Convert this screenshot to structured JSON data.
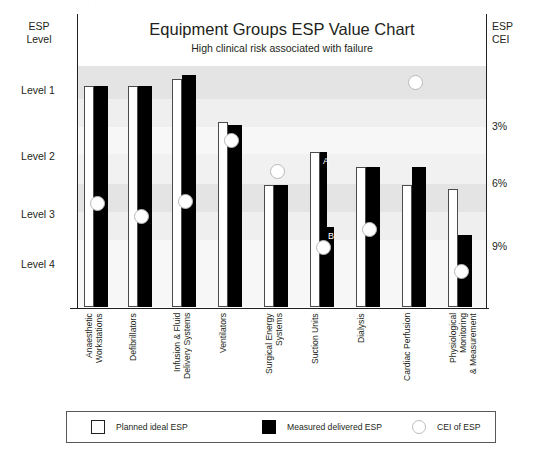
{
  "watermark": "· · ·  ·  ·  ·· ·",
  "header": {
    "title": "Equipment Groups ESP Value Chart",
    "subtitle": "High clinical risk associated with failure",
    "left_axis_title": "ESP\nLevel",
    "left_axis_title_line1": "ESP",
    "left_axis_title_line2": "Level",
    "right_axis_title_line1": "ESP",
    "right_axis_title_line2": "CEI"
  },
  "legend": {
    "items": [
      {
        "label": "Planned ideal ESP",
        "marker": "open-square",
        "color": "#ffffff"
      },
      {
        "label": "Measured delivered ESP",
        "marker": "solid-square",
        "color": "#000000"
      },
      {
        "label": "CEI of ESP",
        "marker": "open-circle",
        "color": "#ffffff"
      }
    ]
  },
  "annotations": [
    {
      "id": "A",
      "text": "A",
      "group": "Suction Units",
      "note": "upper step of measured bar"
    },
    {
      "id": "B",
      "text": "B",
      "group": "Suction Units",
      "note": "lower step of measured bar"
    }
  ],
  "chart_data": {
    "type": "bar",
    "title": "Equipment Groups ESP Value Chart",
    "subtitle": "High clinical risk associated with failure",
    "xlabel": "",
    "ylabel": "ESP Level",
    "y2label": "ESP CEI",
    "grid": false,
    "legend_position": "bottom",
    "ylim": [
      0,
      5
    ],
    "y2lim": [
      0,
      12
    ],
    "ytick_labels": [
      "Level 1",
      "Level 2",
      "Level 3",
      "Level 4"
    ],
    "ytick_values": [
      1,
      2,
      3,
      4
    ],
    "y2tick_labels": [
      "3%",
      "6%",
      "9%"
    ],
    "y2tick_values": [
      3,
      6,
      9
    ],
    "categories": [
      "Anaesthetic\nWorkstations",
      "Defibrillators",
      "Infusion & Fluid\nDelivery Systems",
      "Ventilators",
      "Surgical Energy\nSystems",
      "Suction Units",
      "Dialysis",
      "Cardiac Perfusion",
      "Physiological\nMonitoring\n& Measurement"
    ],
    "series": [
      {
        "name": "Planned ideal ESP",
        "color": "#ffffff",
        "values": [
          4.15,
          4.15,
          4.25,
          3.45,
          2.45,
          3.05,
          2.75,
          2.45,
          2.4
        ]
      },
      {
        "name": "Measured delivered ESP",
        "color": "#000000",
        "values": [
          4.15,
          4.15,
          4.3,
          3.4,
          2.45,
          3.05,
          2.75,
          2.85,
          1.55
        ],
        "step_overrides": [
          {
            "category": "Suction Units",
            "upper": 3.05,
            "lower": 1.55,
            "upper_label": "A",
            "lower_label": "B"
          }
        ]
      }
    ],
    "cei_series": {
      "name": "CEI of ESP",
      "color": "#ffffff",
      "values": [
        5.6,
        5.2,
        5.6,
        8.8,
        6.8,
        3.8,
        4.6,
        10.5,
        2.9
      ]
    }
  },
  "bands": [
    {
      "top": 52,
      "height": 33,
      "color": "#e4e4e4"
    },
    {
      "top": 85,
      "height": 28,
      "color": "#efefef"
    },
    {
      "top": 113,
      "height": 27,
      "color": "#f7f7f7"
    },
    {
      "top": 140,
      "height": 30,
      "color": "#f1f1f1"
    },
    {
      "top": 170,
      "height": 28,
      "color": "#e4e4e4"
    },
    {
      "top": 198,
      "height": 28,
      "color": "#efefef"
    },
    {
      "top": 226,
      "height": 67,
      "color": "#f7f7f7"
    }
  ],
  "geometry": {
    "plot_left": 78,
    "plot_top": 14,
    "plot_width": 408,
    "plot_height": 293,
    "ytick_left_y": [
      84,
      150,
      208,
      258
    ],
    "ytick_right_y": [
      120,
      177,
      240
    ],
    "groups": [
      {
        "x": 6,
        "w_planned": 10,
        "w_measured": 14,
        "h_planned": 221,
        "h_measured": 221,
        "cei_y": 182,
        "label_x": 84
      },
      {
        "x": 50,
        "w_planned": 10,
        "w_measured": 14,
        "h_planned": 221,
        "h_measured": 221,
        "cei_y": 195,
        "label_x": 128
      },
      {
        "x": 94,
        "w_planned": 10,
        "w_measured": 14,
        "h_planned": 228,
        "h_measured": 232,
        "cei_y": 180,
        "label_x": 172
      },
      {
        "x": 140,
        "w_planned": 10,
        "w_measured": 14,
        "h_planned": 185,
        "h_measured": 182,
        "cei_y": 119,
        "label_x": 218
      },
      {
        "x": 186,
        "w_planned": 10,
        "w_measured": 14,
        "h_planned": 122,
        "h_measured": 122,
        "cei_y": 150,
        "label_x": 264
      },
      {
        "x": 232,
        "w_planned": 10,
        "w_measured": 14,
        "h_planned": 155,
        "h_measured": 155,
        "cei_y": 226,
        "label_x": 310,
        "step_h": 80
      },
      {
        "x": 278,
        "w_planned": 10,
        "w_measured": 14,
        "h_planned": 140,
        "h_measured": 140,
        "cei_y": 208,
        "label_x": 356
      },
      {
        "x": 324,
        "w_planned": 10,
        "w_measured": 14,
        "h_planned": 122,
        "h_measured": 140,
        "cei_y": 61,
        "label_x": 402
      },
      {
        "x": 370,
        "w_planned": 10,
        "w_measured": 14,
        "h_planned": 118,
        "h_measured": 72,
        "cei_y": 250,
        "label_x": 448
      }
    ]
  }
}
